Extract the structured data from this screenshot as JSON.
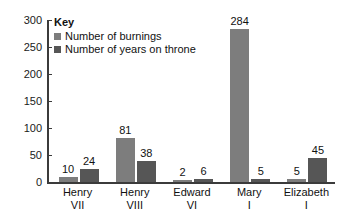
{
  "chart_data": {
    "type": "bar",
    "title": "",
    "xlabel": "",
    "ylabel": "",
    "ylim": [
      0,
      300
    ],
    "yticks": [
      0,
      50,
      100,
      150,
      200,
      250,
      300
    ],
    "ytick_labels": [
      "0",
      "50",
      "100",
      "150",
      "200",
      "250",
      "300"
    ],
    "grid": false,
    "legend_position": "top-left",
    "legend_title": "Key",
    "categories": [
      "Henry VII",
      "Henry VIII",
      "Edward VI",
      "Mary I",
      "Elizabeth I"
    ],
    "category_lines": [
      [
        "Henry",
        "VII"
      ],
      [
        "Henry",
        "VIII"
      ],
      [
        "Edward",
        "VI"
      ],
      [
        "Mary",
        "I"
      ],
      [
        "Elizabeth",
        "I"
      ]
    ],
    "series": [
      {
        "name": "Number of burnings",
        "color": "#7d7d7d",
        "values": [
          10,
          81,
          2,
          284,
          5
        ],
        "value_labels": [
          "10",
          "81",
          "2",
          "284",
          "5"
        ]
      },
      {
        "name": "Number of years on throne",
        "color": "#565656",
        "values": [
          24,
          38,
          6,
          5,
          45
        ],
        "value_labels": [
          "24",
          "38",
          "6",
          "5",
          "45"
        ]
      }
    ]
  },
  "axes": {
    "axis_color": "#3b3b3b"
  }
}
